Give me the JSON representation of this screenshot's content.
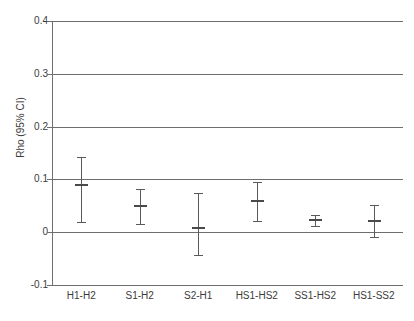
{
  "chart_data": {
    "type": "scatter",
    "title": "",
    "subtitle": "",
    "xlabel": "",
    "ylabel": "Rho (95% CI)",
    "ylim": [
      -0.1,
      0.4
    ],
    "yticks": [
      0.4,
      0.3,
      0.2,
      0.1,
      0,
      -0.1
    ],
    "ytick_labels": [
      "0.4",
      "0.3",
      "0.2",
      "0.1",
      "0",
      "-0.1"
    ],
    "grid": true,
    "legend": "none",
    "categories": [
      "H1-H2",
      "S1-H2",
      "S2-H1",
      "HS1-HS2",
      "SS1-HS2",
      "HS1-SS2"
    ],
    "values": [
      0.089,
      0.05,
      0.008,
      0.059,
      0.024,
      0.021
    ],
    "ci_lower": [
      0.019,
      0.016,
      -0.043,
      0.021,
      0.011,
      -0.009
    ],
    "ci_upper": [
      0.142,
      0.081,
      0.074,
      0.096,
      0.033,
      0.051
    ],
    "series": [
      {
        "name": "Rho",
        "points": [
          {
            "category": "H1-H2",
            "value": 0.089,
            "ci_lower": 0.019,
            "ci_upper": 0.142
          },
          {
            "category": "S1-H2",
            "value": 0.05,
            "ci_lower": 0.016,
            "ci_upper": 0.081
          },
          {
            "category": "S2-H1",
            "value": 0.008,
            "ci_lower": -0.043,
            "ci_upper": 0.074
          },
          {
            "category": "HS1-HS2",
            "value": 0.059,
            "ci_lower": 0.021,
            "ci_upper": 0.096
          },
          {
            "category": "SS1-HS2",
            "value": 0.024,
            "ci_lower": 0.011,
            "ci_upper": 0.033
          },
          {
            "category": "HS1-SS2",
            "value": 0.021,
            "ci_lower": -0.009,
            "ci_upper": 0.051
          }
        ]
      }
    ],
    "colors": {
      "axis": "#6e6e6e",
      "grid": "#6e6e6e",
      "marker": "#4a4a4a",
      "errorbar": "#5a5a5a",
      "text": "#3b3b3b",
      "background": "#ffffff"
    }
  }
}
